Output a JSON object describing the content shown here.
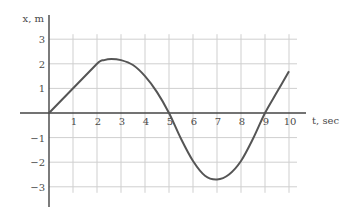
{
  "chart_data": {
    "type": "line",
    "title": "",
    "xlabel": "t, sec",
    "ylabel": "x, m",
    "xlim": [
      0,
      10
    ],
    "ylim": [
      -3,
      3
    ],
    "grid": true,
    "legend": null,
    "x_ticks": [
      "1",
      "2",
      "3",
      "4",
      "5",
      "6",
      "7",
      "8",
      "9",
      "10"
    ],
    "y_ticks": [
      "3",
      "2",
      "1",
      "−1",
      "−2",
      "−3"
    ],
    "series": [
      {
        "name": "position",
        "color": "#555555",
        "x": [
          0,
          1,
          2,
          2.3,
          2.6,
          3,
          3.5,
          4,
          4.5,
          5,
          5.5,
          6,
          6.5,
          7,
          7.5,
          8,
          8.5,
          9,
          9.5,
          10
        ],
        "y": [
          0,
          1,
          2,
          2.15,
          2.2,
          2.15,
          1.95,
          1.5,
          0.85,
          0,
          -1.05,
          -1.95,
          -2.55,
          -2.7,
          -2.5,
          -1.95,
          -1.05,
          0,
          0.85,
          1.7
        ]
      }
    ]
  }
}
